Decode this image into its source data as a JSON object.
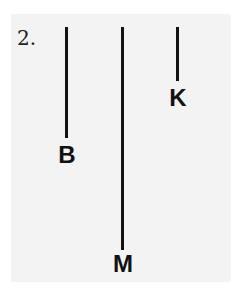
{
  "problem": {
    "number": "2."
  },
  "lines": [
    {
      "label": "B",
      "x": 66,
      "y_top": 27,
      "y_bottom": 138,
      "label_top": 143
    },
    {
      "label": "M",
      "x": 122,
      "y_top": 27,
      "y_bottom": 250,
      "label_top": 252
    },
    {
      "label": "K",
      "x": 177,
      "y_top": 27,
      "y_bottom": 81,
      "label_top": 86
    }
  ],
  "colors": {
    "line": "#111111",
    "background": "#f3f3f3"
  }
}
